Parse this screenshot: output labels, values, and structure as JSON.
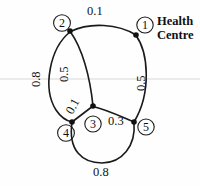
{
  "diagram": {
    "annotation": {
      "line1": "Health",
      "line2": "Centre"
    },
    "nodes": [
      {
        "id": "1",
        "label": "①",
        "dot_x": 136,
        "dot_y": 35,
        "label_x": 145,
        "label_y": 25
      },
      {
        "id": "2",
        "label": "②",
        "dot_x": 70,
        "dot_y": 31,
        "label_x": 62,
        "label_y": 23
      },
      {
        "id": "3",
        "label": "③",
        "dot_x": 93,
        "dot_y": 106,
        "label_x": 93,
        "label_y": 124
      },
      {
        "id": "4",
        "label": "④",
        "dot_x": 72,
        "dot_y": 122,
        "label_x": 66,
        "label_y": 133
      },
      {
        "id": "5",
        "label": "⑤",
        "dot_x": 134,
        "dot_y": 122,
        "label_x": 146,
        "label_y": 127
      }
    ],
    "edges": [
      {
        "from": "2",
        "to": "1",
        "weight": "0.1",
        "label_x": 97,
        "label_y": 11,
        "rotation": 0
      },
      {
        "from": "2",
        "to": "4",
        "weight": "0.8",
        "label_x": 36,
        "label_y": 79,
        "rotation": -90
      },
      {
        "from": "2",
        "to": "3",
        "weight": "0.5",
        "label_x": 64,
        "label_y": 74,
        "rotation": -90
      },
      {
        "from": "1",
        "to": "5",
        "weight": "0.5",
        "label_x": 141,
        "label_y": 83,
        "rotation": -90
      },
      {
        "from": "4",
        "to": "3",
        "weight": "0.1",
        "label_x": 73,
        "label_y": 106,
        "rotation": -62
      },
      {
        "from": "3",
        "to": "5",
        "weight": "0.3",
        "label_x": 117,
        "label_y": 121,
        "rotation": 0
      },
      {
        "from": "4",
        "to": "5",
        "weight": "0.8",
        "label_x": 102,
        "label_y": 170,
        "rotation": 0
      }
    ],
    "colors": {
      "ink": "#111111",
      "paper": "#fefefe",
      "scan_artifact": "#d8d8d8"
    }
  }
}
